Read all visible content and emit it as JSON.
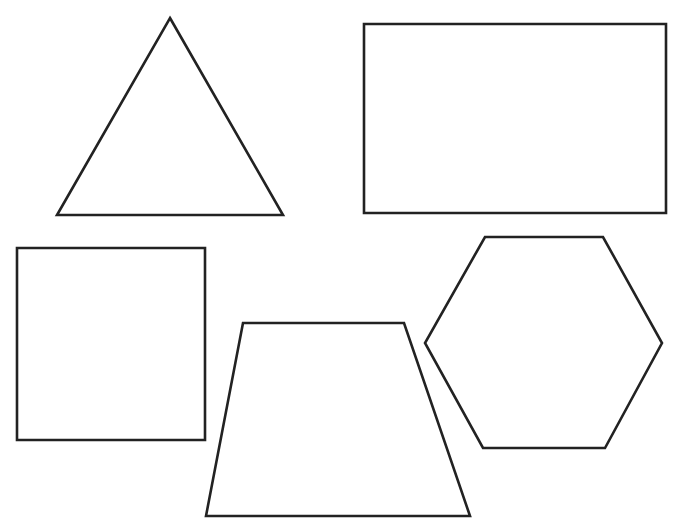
{
  "canvas": {
    "width": 678,
    "height": 531,
    "background": "#ffffff"
  },
  "style": {
    "stroke": "#222222",
    "stroke_width": 2.6,
    "fill": "#ffffff"
  },
  "shapes": [
    {
      "name": "triangle",
      "type": "polygon",
      "points": "170,18 283,215 57,215"
    },
    {
      "name": "rectangle",
      "type": "polygon",
      "points": "364,24 666,24 666,213 364,213"
    },
    {
      "name": "square",
      "type": "polygon",
      "points": "17,248 205,248 205,440 17,440"
    },
    {
      "name": "trapezoid",
      "type": "polygon",
      "points": "243,323 404,323 470,516 206,516"
    },
    {
      "name": "hexagon",
      "type": "polygon",
      "points": "485,237 603,237 662,343 605,448 483,448 425,343"
    }
  ]
}
